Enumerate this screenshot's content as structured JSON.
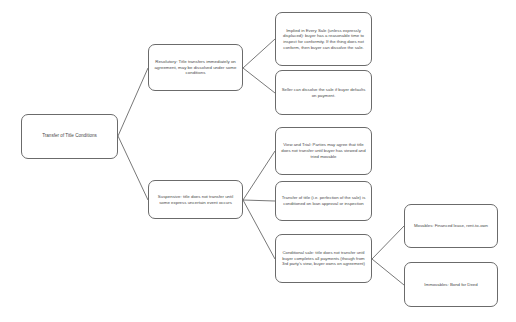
{
  "diagram": {
    "type": "tree-flowchart",
    "title": "Transfer of Title Conditions",
    "edge_color": "#555555",
    "node_border_color": "#6b6b6b",
    "text_color": "#4a4a4a",
    "background_color": "#ffffff",
    "nodes": {
      "root": "Transfer of Title Conditions",
      "resolutory": "Resolutory:  Title transfers immediately on agreement, may be dissolved under some conditions",
      "suspensive": "Suspensive: title does not transfer until some express uncertain event occurs",
      "implied_in_every_sale": "Implied in Every Sale (unless expressly displaced): buyer has a reasonable time to inspect for conformity.  If the thing does not conform, then buyer can dissolve the sale.",
      "seller_dissolve": "Seller can dissolve the sale if buyer defaults on payment.",
      "view_and_trial": "View and Trial:  Parties may agree that title does not transfer until buyer has viewed and tried movable",
      "transfer_conditioned": "Transfer of title (i.e. perfection of the sale) is conditioned on loan approval or inspection",
      "conditional_sale": "Conditional sale: title does not transfer until buyer completes all payments (though from 3rd party's view, buyer owns on agreement)",
      "movables": "Movables:  Financed lease, rent-to-own",
      "immovables": "Immovables: Bond for Deed"
    },
    "edges": [
      {
        "from": "root",
        "to": "resolutory"
      },
      {
        "from": "root",
        "to": "suspensive"
      },
      {
        "from": "resolutory",
        "to": "implied_in_every_sale"
      },
      {
        "from": "resolutory",
        "to": "seller_dissolve"
      },
      {
        "from": "suspensive",
        "to": "view_and_trial"
      },
      {
        "from": "suspensive",
        "to": "transfer_conditioned"
      },
      {
        "from": "suspensive",
        "to": "conditional_sale"
      },
      {
        "from": "conditional_sale",
        "to": "movables"
      },
      {
        "from": "conditional_sale",
        "to": "immovables"
      }
    ]
  }
}
